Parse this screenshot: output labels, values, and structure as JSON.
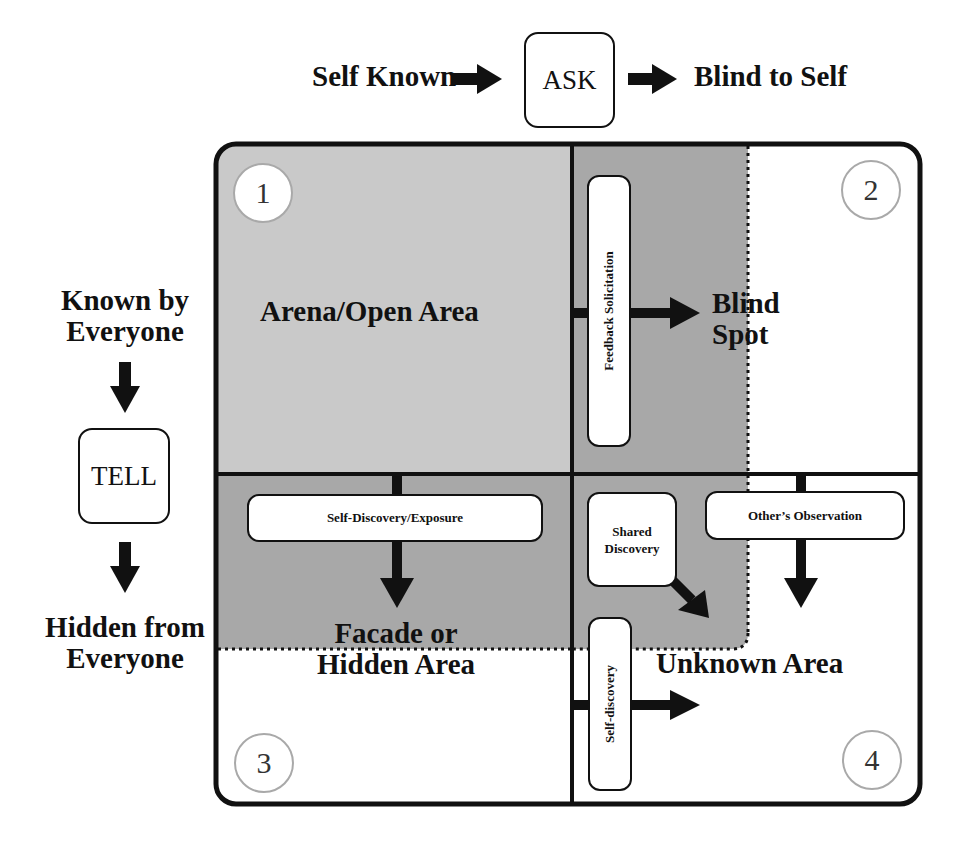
{
  "top_axis": {
    "left_label": "Self Known",
    "center_box": "ASK",
    "right_label": "Blind to Self"
  },
  "left_axis": {
    "top_label_line1": "Known by",
    "top_label_line2": "Everyone",
    "center_box": "TELL",
    "bottom_label_line1": "Hidden from",
    "bottom_label_line2": "Everyone"
  },
  "quadrants": [
    {
      "number": "1",
      "label": "Arena/Open Area"
    },
    {
      "number": "2",
      "label_line1": "Blind",
      "label_line2": "Spot"
    },
    {
      "number": "3",
      "label_line1": "Facade or",
      "label_line2": "Hidden Area"
    },
    {
      "number": "4",
      "label": "Unknown Area"
    }
  ],
  "processes": {
    "feedback": "Feedback Solicitation",
    "self_exposure": "Self-Discovery/Exposure",
    "shared_line1": "Shared",
    "shared_line2": "Discovery",
    "others_observation": "Other’s Observation",
    "self_discovery": "Self-discovery"
  },
  "colors": {
    "open_area": "#c9c9c9",
    "shaded_area": "#a8a8a8",
    "border": "#111111",
    "circle_border": "#a9a9a9"
  }
}
